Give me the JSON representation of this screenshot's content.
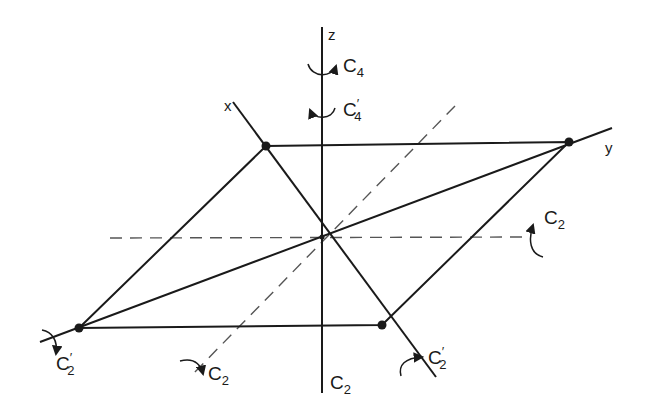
{
  "figure": {
    "type": "symmetry-elements-diagram"
  },
  "axes": {
    "x": {
      "label": "x"
    },
    "y": {
      "label": "y"
    },
    "z": {
      "label": "z"
    }
  },
  "operations": {
    "c4": {
      "main": "C",
      "sub": "4",
      "prime": ""
    },
    "c4p": {
      "main": "C",
      "sub": "4",
      "prime": "′"
    },
    "c2_right": {
      "main": "C",
      "sub": "2",
      "prime": ""
    },
    "c2_bottom_diag": {
      "main": "C",
      "sub": "2",
      "prime": ""
    },
    "c2_z": {
      "main": "C",
      "sub": "2",
      "prime": ""
    },
    "c2p_left": {
      "main": "C",
      "sub": "2",
      "prime": "′"
    },
    "c2p_right": {
      "main": "C",
      "sub": "2",
      "prime": "′"
    }
  },
  "colors": {
    "line": "#1a1a1a",
    "dash": "#555555",
    "background": "#ffffff"
  }
}
